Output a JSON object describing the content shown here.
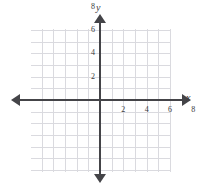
{
  "figure": {
    "type": "coordinate-plane",
    "background_color": "#ffffff",
    "grid_color": "#dadadf",
    "axis_color": "#444448",
    "label_color": "#3b3b40"
  },
  "axes": {
    "x_axis_label": "x",
    "y_axis_label": "y",
    "x_arrow_left": "arrow-left",
    "x_arrow_right": "arrow-right",
    "y_arrow_up": "arrow-up",
    "y_arrow_down": "arrow-down"
  },
  "chart_data": {
    "type": "scatter",
    "title": "",
    "subtitle": "",
    "xlabel": "x",
    "ylabel": "y",
    "xlim": [
      -6,
      12
    ],
    "ylim": [
      -6,
      12
    ],
    "grid": true,
    "grid_step": 1,
    "tick_step": 2,
    "legend": "none",
    "x_tick_labels": [
      "2",
      "4",
      "6",
      "8",
      "10"
    ],
    "x_tick_values": [
      2,
      4,
      6,
      8,
      10
    ],
    "y_tick_labels": [
      "2",
      "4",
      "6",
      "8",
      "10"
    ],
    "y_tick_values": [
      2,
      4,
      6,
      8,
      10
    ],
    "series": [
      {
        "name": "",
        "x": [],
        "y": []
      }
    ],
    "annotations": [],
    "note": "Empty blank coordinate grid with labeled positive axes only; no plotted data points or curves."
  }
}
